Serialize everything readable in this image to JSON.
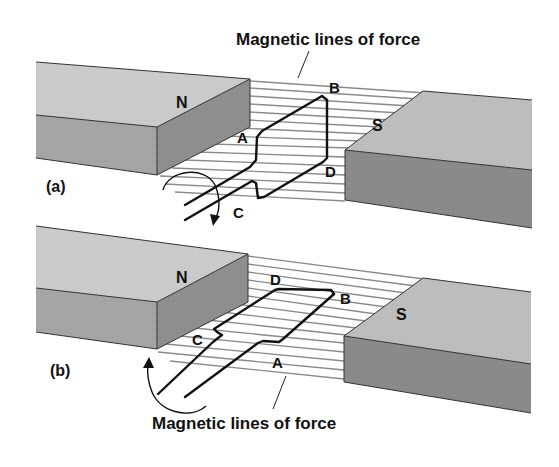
{
  "figure": {
    "panel_a": {
      "label": "(a)",
      "top_caption": "Magnetic lines of force",
      "north_pole_label": "N",
      "south_pole_label": "S",
      "loop_corners": {
        "A": "A",
        "B": "B",
        "C": "C",
        "D": "D"
      },
      "loop_orientation": "vertical",
      "rotation_arrow": "clockwise-down"
    },
    "panel_b": {
      "label": "(b)",
      "bottom_caption": "Magnetic lines of force",
      "north_pole_label": "N",
      "south_pole_label": "S",
      "loop_corners": {
        "A": "A",
        "B": "B",
        "C": "C",
        "D": "D"
      },
      "loop_orientation": "horizontal",
      "rotation_arrow": "counterclockwise-up"
    },
    "colors": {
      "magnet_top": "#c9c9c9",
      "magnet_front": "#a3a3a3",
      "magnet_side": "#8f8f8f",
      "south_front": "#8c8c8c",
      "field_lines": "#8a8a8a",
      "wire": "#111111"
    }
  }
}
